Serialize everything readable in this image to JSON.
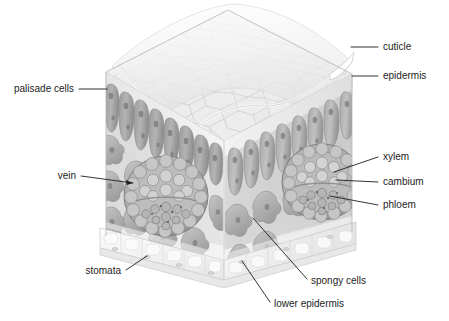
{
  "figure": {
    "background_color": "#ffffff",
    "ink_color": "#1d1d1d",
    "style": "grayscale scientific illustration"
  },
  "palette": {
    "cuticle": "#f4f4f4",
    "upper_epidermis": "#e9e9e9",
    "epidermis_mosaic": "#efefef",
    "epidermis_mosaic_line": "#cfcfcf",
    "palisade_light": "#c9c9c9",
    "palisade_mid": "#a6a6a6",
    "palisade_dark": "#8d8d8d",
    "spongy_light": "#cdcdcd",
    "spongy_mid": "#adadad",
    "spongy_dark": "#919191",
    "airspace": "#e4e4e4",
    "vein_ring": "#a2a2a2",
    "vein_cell": "#c4c4c4",
    "xylem_cell": "#cbcbcb",
    "phloem_cell": "#b4b4b4",
    "cambium_band": "#9a9a9a",
    "lower_epidermis": "#f2f2f2",
    "lower_epidermis_line": "#d8d8d8",
    "outline": "#9f9f9f"
  },
  "labels": [
    {
      "id": "cuticle",
      "text": "cuticle",
      "text_x": 383,
      "text_y": 47,
      "anchor": "start",
      "leader": "M 351 47 L 378 47",
      "tip": {
        "x": 351,
        "y": 47
      },
      "arrow": false,
      "side": "right"
    },
    {
      "id": "epidermis",
      "text": "epidermis",
      "text_x": 383,
      "text_y": 77,
      "anchor": "start",
      "leader": "M 352 76 L 378 76",
      "tip": {
        "x": 352,
        "y": 76
      },
      "arrow": false,
      "side": "right"
    },
    {
      "id": "palisade-cells",
      "text": "palisade cells",
      "text_x": 74,
      "text_y": 93,
      "anchor": "end",
      "leader": "M 79 89 L 107 89",
      "tip": {
        "x": 107,
        "y": 89
      },
      "arrow": false,
      "side": "left"
    },
    {
      "id": "xylem",
      "text": "xylem",
      "text_x": 383,
      "text_y": 160,
      "anchor": "start",
      "leader": "M 334 172 L 378 157",
      "tip": {
        "x": 334,
        "y": 172
      },
      "arrow": false,
      "side": "right"
    },
    {
      "id": "cambium",
      "text": "cambium",
      "text_x": 383,
      "text_y": 185,
      "anchor": "start",
      "leader": "M 336 180 L 378 182",
      "tip": {
        "x": 336,
        "y": 180
      },
      "arrow": false,
      "side": "right"
    },
    {
      "id": "phloem",
      "text": "phloem",
      "text_x": 383,
      "text_y": 208,
      "anchor": "start",
      "leader": "M 330 196 L 378 205",
      "tip": {
        "x": 330,
        "y": 196
      },
      "arrow": false,
      "side": "right"
    },
    {
      "id": "vein",
      "text": "vein",
      "text_x": 76,
      "text_y": 179,
      "anchor": "end",
      "leader": "M 81 176 L 133 183",
      "tip": {
        "x": 133,
        "y": 183
      },
      "arrow": true,
      "side": "left"
    },
    {
      "id": "stomata",
      "text": "stomata",
      "text_x": 121,
      "text_y": 274,
      "anchor": "end",
      "leader": "M 126 270 L 147 256",
      "tip": {
        "x": 147,
        "y": 256
      },
      "arrow": false,
      "side": "left"
    },
    {
      "id": "spongy-cells",
      "text": "spongy cells",
      "text_x": 311,
      "text_y": 284,
      "anchor": "start",
      "leader": "M 253 218 L 307 279",
      "tip": {
        "x": 253,
        "y": 218
      },
      "arrow": false,
      "side": "bottom"
    },
    {
      "id": "lower-epidermis",
      "text": "lower epidermis",
      "text_x": 274,
      "text_y": 307,
      "anchor": "start",
      "leader": "M 242 261 L 270 302",
      "tip": {
        "x": 242,
        "y": 261
      },
      "arrow": false,
      "side": "bottom"
    }
  ],
  "structures": {
    "top_face": "upper epidermal cell mosaic seen from above",
    "cuticle_flap": "transparent cuticle sheet peeled up off the upper epidermis",
    "left_face": "cut cross-section showing palisade layer over spongy mesophyll and a vein",
    "right_face": "cut cross-section showing palisade layer over spongy mesophyll and a vein",
    "bottom_face": "lower epidermis slab with stomata openings",
    "vein_count": 2,
    "palisade_row_count": 2
  }
}
